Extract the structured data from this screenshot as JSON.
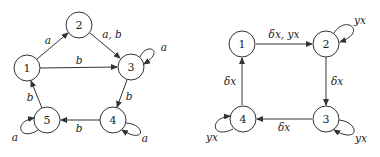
{
  "diagrams": [
    {
      "id": "left",
      "nodes": [
        {
          "id": "1",
          "label": "1",
          "x": 27,
          "y": 68
        },
        {
          "id": "2",
          "label": "2",
          "x": 79,
          "y": 25
        },
        {
          "id": "3",
          "label": "3",
          "x": 131,
          "y": 67
        },
        {
          "id": "4",
          "label": "4",
          "x": 113,
          "y": 120
        },
        {
          "id": "5",
          "label": "5",
          "x": 47,
          "y": 120
        }
      ],
      "edges": [
        {
          "from": "1",
          "to": "2",
          "label": "a"
        },
        {
          "from": "2",
          "to": "3",
          "label": "a, b"
        },
        {
          "from": "1",
          "to": "3",
          "label": "b"
        },
        {
          "from": "3",
          "to": "3",
          "label": "a"
        },
        {
          "from": "3",
          "to": "4",
          "label": "b"
        },
        {
          "from": "4",
          "to": "4",
          "label": "a"
        },
        {
          "from": "4",
          "to": "5",
          "label": "b"
        },
        {
          "from": "5",
          "to": "5",
          "label": "a"
        },
        {
          "from": "5",
          "to": "1",
          "label": "b"
        }
      ]
    },
    {
      "id": "right",
      "nodes": [
        {
          "id": "1",
          "label": "1",
          "x": 242,
          "y": 44
        },
        {
          "id": "2",
          "label": "2",
          "x": 326,
          "y": 44
        },
        {
          "id": "3",
          "label": "3",
          "x": 326,
          "y": 119
        },
        {
          "id": "4",
          "label": "4",
          "x": 243,
          "y": 119
        }
      ],
      "edges": [
        {
          "from": "1",
          "to": "2",
          "label": "δx, yx"
        },
        {
          "from": "2",
          "to": "2",
          "label": "yx"
        },
        {
          "from": "2",
          "to": "3",
          "label": "δx"
        },
        {
          "from": "3",
          "to": "3",
          "label": "yx"
        },
        {
          "from": "3",
          "to": "4",
          "label": "δx"
        },
        {
          "from": "4",
          "to": "4",
          "label": "yx"
        },
        {
          "from": "4",
          "to": "1",
          "label": "δx"
        }
      ]
    }
  ]
}
